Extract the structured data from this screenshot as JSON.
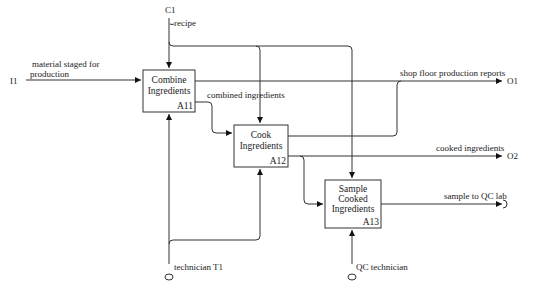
{
  "diagram": {
    "type": "IDEF0",
    "activities": [
      {
        "id": "A11",
        "line1": "Combine",
        "line2": "Ingredients",
        "line3": ""
      },
      {
        "id": "A12",
        "line1": "Cook",
        "line2": "Ingredients",
        "line3": ""
      },
      {
        "id": "A13",
        "line1": "Sample",
        "line2": "Cooked",
        "line3": "Ingredients"
      }
    ],
    "inputs": [
      {
        "code": "I1",
        "label_line1": "material staged for",
        "label_line2": "production"
      }
    ],
    "controls": [
      {
        "code": "C1",
        "label": "recipe"
      }
    ],
    "outputs": [
      {
        "code": "O1",
        "label": "shop floor production reports"
      },
      {
        "code": "O2",
        "label": "cooked ingredients"
      },
      {
        "code": "",
        "label": "sample to QC lab"
      }
    ],
    "mechanisms": [
      {
        "code": "T1",
        "label": "technician T1"
      },
      {
        "code": "",
        "label": "QC technician"
      }
    ],
    "internal_arrows": [
      {
        "label": "combined ingredients"
      }
    ],
    "colors": {
      "line": "#333333",
      "background": "#ffffff",
      "text": "#222222"
    }
  }
}
